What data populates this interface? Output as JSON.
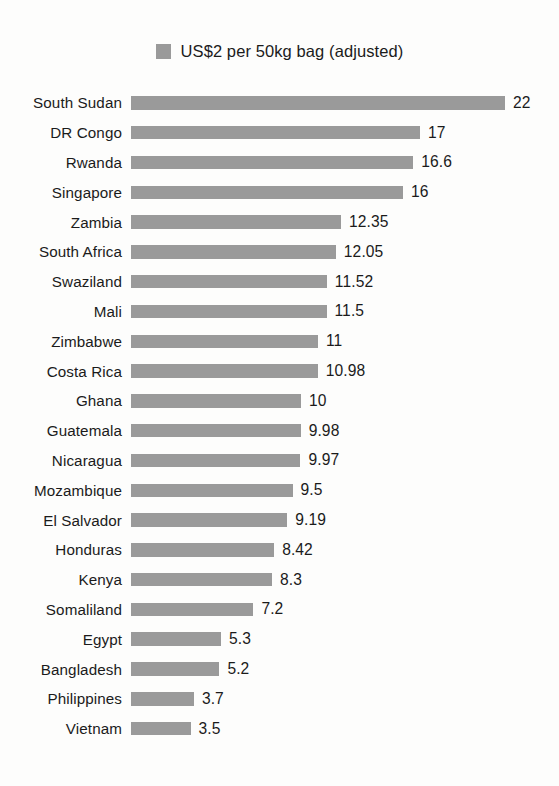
{
  "chart_data": {
    "type": "bar",
    "orientation": "horizontal",
    "title": "",
    "subtitle": "",
    "xlabel": "",
    "ylabel": "",
    "grid": false,
    "legend_position": "top-center",
    "legend": [
      {
        "label": "US$2 per 50kg bag (adjusted)",
        "color": "#9a9a9a"
      }
    ],
    "series": [
      {
        "name": "US$2 per 50kg bag (adjusted)",
        "color": "#9a9a9a",
        "values": [
          22,
          17,
          16.6,
          16,
          12.35,
          12.05,
          11.52,
          11.5,
          11,
          10.98,
          10,
          9.98,
          9.97,
          9.5,
          9.19,
          8.42,
          8.3,
          7.2,
          5.3,
          5.2,
          3.7,
          3.5
        ]
      }
    ],
    "categories": [
      "South Sudan",
      "DR Congo",
      "Rwanda",
      "Singapore",
      "Zambia",
      "South Africa",
      "Swaziland",
      "Mali",
      "Zimbabwe",
      "Costa Rica",
      "Ghana",
      "Guatemala",
      "Nicaragua",
      "Mozambique",
      "El Salvador",
      "Honduras",
      "Kenya",
      "Somaliland",
      "Egypt",
      "Bangladesh",
      "Philippines",
      "Vietnam"
    ],
    "value_labels": [
      "22",
      "17",
      "16.6",
      "16",
      "12.35",
      "12.05",
      "11.52",
      "11.5",
      "11",
      "10.98",
      "10",
      "9.98",
      "9.97",
      "9.5",
      "9.19",
      "8.42",
      "8.3",
      "7.2",
      "5.3",
      "5.2",
      "3.7",
      "3.5"
    ],
    "xlim": [
      0,
      22
    ],
    "px_per_unit": 17,
    "bar_color": "#9a9a9a",
    "background_color": "#fdfdfc",
    "text_color": "#1b1b1b"
  }
}
